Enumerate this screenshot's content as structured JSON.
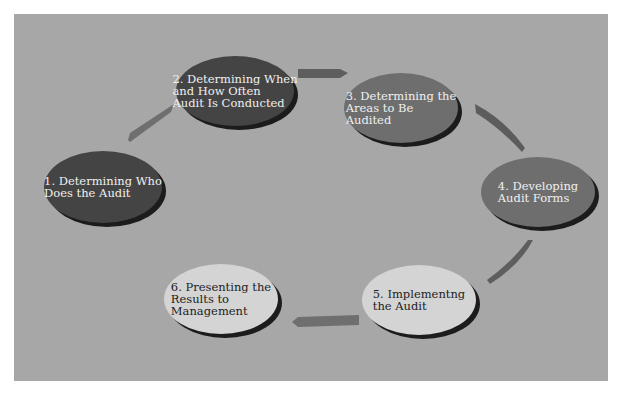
{
  "diagram": {
    "type": "cycle",
    "colors": {
      "background": "#a7a7a7",
      "node_dark": "#444444",
      "node_mid": "#6e6e6e",
      "node_light": "#d4d4d4",
      "arrow": "#6f6f6f",
      "shadow": "#1c1c1c"
    },
    "steps": [
      {
        "label": "1. Determining Who\nDoes the Audit"
      },
      {
        "label": "2. Determining When\nand How Often\nAudit Is Conducted"
      },
      {
        "label": "3. Determining the\nAreas to Be\nAudited"
      },
      {
        "label": "4. Developing\nAudit Forms"
      },
      {
        "label": "5. Implementng\nthe Audit"
      },
      {
        "label": "6. Presenting the\nResults to\nManagement"
      }
    ]
  }
}
